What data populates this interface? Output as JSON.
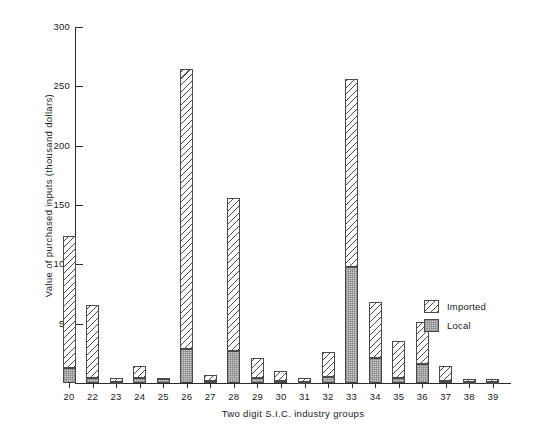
{
  "chart_data": {
    "type": "bar",
    "subtype": "stacked",
    "title": "",
    "xlabel": "Two digit S.I.C. industry groups",
    "ylabel": "Value of purchased inputs (thousand dollars)",
    "categories": [
      "20",
      "22",
      "23",
      "24",
      "25",
      "26",
      "27",
      "28",
      "29",
      "30",
      "31",
      "32",
      "33",
      "34",
      "35",
      "36",
      "37",
      "38",
      "39"
    ],
    "series": [
      {
        "name": "Local",
        "color": "#cfcfcf",
        "values": [
          13,
          4,
          1,
          4,
          3,
          29,
          2,
          27,
          4,
          2,
          1,
          5,
          98,
          21,
          4,
          16,
          2,
          1,
          1
        ]
      },
      {
        "name": "Imported",
        "color": "#ffffff",
        "values": [
          111,
          62,
          3,
          10,
          1,
          236,
          5,
          129,
          17,
          8,
          3,
          21,
          158,
          47,
          31,
          35,
          12,
          2,
          2
        ]
      }
    ],
    "totals": [
      124,
      66,
      4,
      14,
      4,
      265,
      7,
      156,
      21,
      10,
      4,
      26,
      256,
      68,
      35,
      51,
      14,
      3,
      3
    ],
    "ylim": [
      0,
      300
    ],
    "yticks": [
      50,
      100,
      150,
      200,
      250,
      300
    ],
    "ytick_labels": [
      "50",
      "100",
      "150",
      "200",
      "250",
      "300"
    ],
    "grid": false,
    "legend": {
      "position": "right",
      "entries": [
        {
          "label": "Imported",
          "pattern": "diagonal-hatch"
        },
        {
          "label": "Local",
          "pattern": "solid-gray-grid"
        }
      ]
    }
  }
}
